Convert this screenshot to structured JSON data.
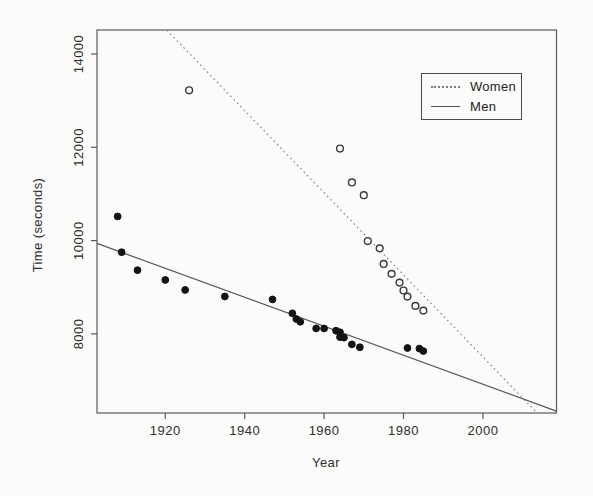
{
  "figure": {
    "background": "#fbfbfa",
    "axis_color": "#5a5a5a",
    "tick_text_color": "#2e2e2e",
    "women_color": "#3a3a3a",
    "men_color": "#141414"
  },
  "chart_data": {
    "type": "scatter",
    "title": "",
    "xlabel": "Year",
    "ylabel": "Time (seconds)",
    "xlim": [
      1903,
      2018.5
    ],
    "ylim": [
      6300,
      14515
    ],
    "x_ticks": [
      1920,
      1940,
      1960,
      1980,
      2000
    ],
    "y_ticks": [
      8000,
      10000,
      12000,
      14000
    ],
    "grid": false,
    "legend": {
      "position": "top-right"
    },
    "series": [
      {
        "name": "Women",
        "marker": "open-circle",
        "line_style": "dotted",
        "points": [
          [
            1926,
            13222
          ],
          [
            1964,
            11973
          ],
          [
            1967,
            11246
          ],
          [
            1970,
            10973
          ],
          [
            1971,
            9990
          ],
          [
            1974,
            9834
          ],
          [
            1975,
            9499
          ],
          [
            1977,
            9287
          ],
          [
            1979,
            9100
          ],
          [
            1980,
            8930
          ],
          [
            1981,
            8800
          ],
          [
            1983,
            8600
          ],
          [
            1985,
            8500
          ]
        ],
        "fit_line": {
          "style": "dotted",
          "from": [
            1920.4,
            14510
          ],
          "to": [
            2013.6,
            6310
          ]
        }
      },
      {
        "name": "Men",
        "marker": "filled-circle",
        "line_style": "solid",
        "points": [
          [
            1908,
            10518
          ],
          [
            1909,
            9751
          ],
          [
            1913,
            9366
          ],
          [
            1920,
            9156
          ],
          [
            1925,
            8942
          ],
          [
            1935,
            8802
          ],
          [
            1947,
            8739
          ],
          [
            1952,
            8442
          ],
          [
            1953,
            8320
          ],
          [
            1954,
            8259
          ],
          [
            1958,
            8117
          ],
          [
            1960,
            8116
          ],
          [
            1963,
            8068
          ],
          [
            1964,
            8035
          ],
          [
            1964,
            7931
          ],
          [
            1965,
            7920
          ],
          [
            1967,
            7776
          ],
          [
            1969,
            7714
          ],
          [
            1981,
            7698
          ],
          [
            1984,
            7685
          ],
          [
            1985,
            7632
          ]
        ],
        "fit_line": {
          "style": "solid",
          "from": [
            1902.8,
            9940
          ],
          "to": [
            2018.5,
            6345
          ]
        }
      }
    ]
  }
}
